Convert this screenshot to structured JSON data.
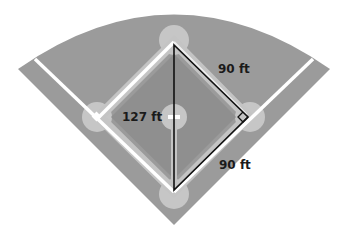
{
  "diagram": {
    "labels": {
      "top_side": "90 ft",
      "diagonal": "127 ft",
      "bottom_side": "90 ft"
    },
    "colors": {
      "field": "#9a9a9a",
      "infield": "#8f8f8f",
      "base_path": "#c4c4c4",
      "base_circle": "#c9c9c9",
      "foul_line": "#ffffff",
      "triangle_stroke": "#111111",
      "background": "#ffffff"
    }
  }
}
